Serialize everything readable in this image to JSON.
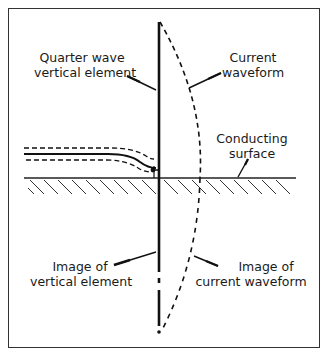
{
  "diagram": {
    "labels": {
      "vertical_element": {
        "line1": "Quarter wave",
        "line2": "vertical element"
      },
      "current_waveform": {
        "line1": "Current",
        "line2": "waveform"
      },
      "conducting_surface": {
        "line1": "Conducting",
        "line2": "surface"
      },
      "image_vertical": {
        "line1": "Image of",
        "line2": "vertical element"
      },
      "image_waveform": {
        "line1": "Image of",
        "line2": "current waveform"
      }
    },
    "colors": {
      "ink": "#1a1a1a",
      "frame": "#333333",
      "background": "#ffffff"
    }
  }
}
